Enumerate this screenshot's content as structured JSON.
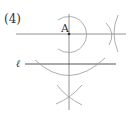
{
  "problem_number": "(4)",
  "point_label": "A",
  "line_label": "ℓ",
  "colors": {
    "line": "#555555",
    "arc": "#888888",
    "text": "#333333"
  }
}
